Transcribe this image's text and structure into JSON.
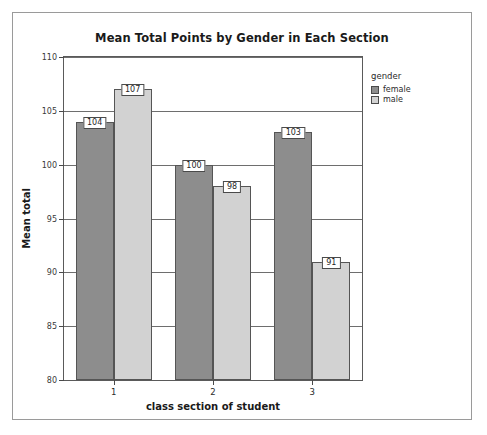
{
  "chart_data": {
    "type": "bar",
    "title": "Mean Total Points by Gender in Each Section",
    "xlabel": "class section of student",
    "ylabel": "Mean total",
    "categories": [
      "1",
      "2",
      "3"
    ],
    "series": [
      {
        "name": "female",
        "values": [
          104,
          100,
          103
        ],
        "color": "#8d8d8d"
      },
      {
        "name": "male",
        "values": [
          107,
          98,
          91
        ],
        "color": "#d2d2d2"
      }
    ],
    "ylim": [
      80,
      110
    ],
    "yticks": [
      80,
      85,
      90,
      95,
      100,
      105,
      110
    ],
    "ytick_labels": [
      "80",
      "85",
      "90",
      "95",
      "100",
      "105",
      "110"
    ],
    "grid": true,
    "show_value_labels": true,
    "legend": {
      "title": "gender",
      "position": "right"
    }
  }
}
